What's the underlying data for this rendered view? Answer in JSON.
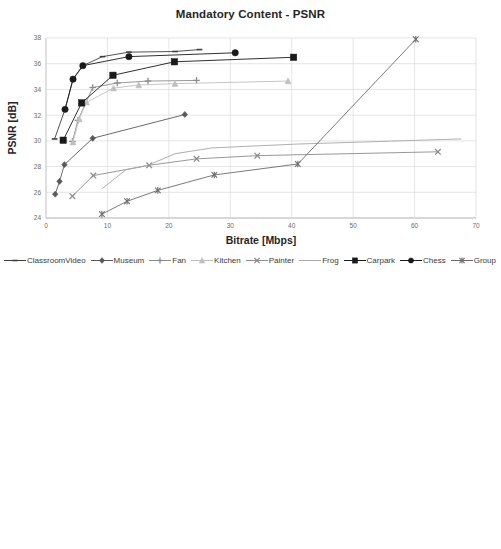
{
  "chart_data": [
    {
      "type": "line",
      "id": "mandatory-content-psnr",
      "title": "Mandatory Content - PSNR",
      "xlabel": "Bitrate [Mbps]",
      "ylabel": "PSNR [dB]",
      "xlim": [
        0,
        70
      ],
      "ylim": [
        24,
        38
      ],
      "xticks": [
        0,
        10,
        20,
        30,
        40,
        50,
        60,
        70
      ],
      "yticks": [
        24,
        26,
        28,
        30,
        32,
        34,
        36,
        38
      ],
      "grid": true,
      "legend_position": "bottom",
      "series": [
        {
          "name": "ClassroomVideo",
          "marker": "dash",
          "color": "#3f3f3f",
          "points": [
            [
              1.4,
              30.15
            ],
            [
              3.1,
              32.45
            ],
            [
              4.4,
              34.8
            ],
            [
              6.0,
              35.85
            ],
            [
              9.2,
              36.55
            ],
            [
              13.5,
              36.9
            ],
            [
              21.0,
              36.95
            ],
            [
              25.0,
              37.1
            ]
          ]
        },
        {
          "name": "Museum",
          "marker": "diamond",
          "color": "#595959",
          "points": [
            [
              1.5,
              25.85
            ],
            [
              2.2,
              26.85
            ],
            [
              3.0,
              28.15
            ],
            [
              7.6,
              30.2
            ],
            [
              22.6,
              32.05
            ]
          ]
        },
        {
          "name": "Fan",
          "marker": "plus",
          "color": "#8c8c8c",
          "points": [
            [
              4.3,
              29.95
            ],
            [
              5.2,
              31.6
            ],
            [
              7.6,
              34.15
            ],
            [
              11.6,
              34.5
            ],
            [
              16.6,
              34.65
            ],
            [
              24.5,
              34.7
            ]
          ]
        },
        {
          "name": "Kitchen",
          "marker": "triangle",
          "color": "#bfbfbf",
          "points": [
            [
              4.4,
              29.9
            ],
            [
              5.4,
              31.7
            ],
            [
              6.6,
              33.0
            ],
            [
              11.0,
              34.1
            ],
            [
              15.1,
              34.35
            ],
            [
              21.0,
              34.45
            ],
            [
              39.4,
              34.65
            ]
          ]
        },
        {
          "name": "Painter",
          "marker": "x",
          "color": "#8c8c8c",
          "points": [
            [
              4.3,
              25.7
            ],
            [
              7.7,
              27.3
            ],
            [
              16.8,
              28.1
            ],
            [
              24.5,
              28.6
            ],
            [
              34.4,
              28.85
            ],
            [
              63.8,
              29.15
            ]
          ]
        },
        {
          "name": "Frog",
          "marker": "none",
          "color": "#a6a6a6",
          "points": [
            [
              9.2,
              26.3
            ],
            [
              13.0,
              27.75
            ],
            [
              16.6,
              28.1
            ],
            [
              21.0,
              29.0
            ],
            [
              27.0,
              29.45
            ],
            [
              40.8,
              29.75
            ],
            [
              67.6,
              30.15
            ]
          ]
        },
        {
          "name": "Carpark",
          "marker": "square",
          "color": "#1a1a1a",
          "points": [
            [
              2.8,
              30.05
            ],
            [
              5.8,
              32.95
            ],
            [
              10.9,
              35.1
            ],
            [
              20.9,
              36.15
            ],
            [
              40.3,
              36.5
            ]
          ]
        },
        {
          "name": "Chess",
          "marker": "circle",
          "color": "#1a1a1a",
          "points": [
            [
              3.1,
              32.45
            ],
            [
              4.4,
              34.8
            ],
            [
              6.0,
              35.85
            ],
            [
              13.5,
              36.55
            ],
            [
              30.8,
              36.85
            ]
          ]
        },
        {
          "name": "Group",
          "marker": "asterisk",
          "color": "#6b6b6b",
          "points": [
            [
              9.1,
              24.3
            ],
            [
              13.2,
              25.3
            ],
            [
              18.2,
              26.15
            ],
            [
              27.4,
              27.35
            ],
            [
              41.0,
              28.2
            ],
            [
              60.2,
              37.9
            ]
          ]
        }
      ]
    },
    {
      "type": "line",
      "id": "optional-content-psnr",
      "title": "Optional Content - PSNR",
      "xlabel": "Bitrate [Mbps]",
      "ylabel": "PSNR [dB]",
      "xlim": [
        0,
        50
      ],
      "ylim": [
        25,
        45
      ],
      "xticks": [
        0,
        5,
        10,
        15,
        20,
        25,
        30,
        35,
        40,
        45,
        50
      ],
      "yticks": [
        25,
        27,
        29,
        31,
        33,
        35,
        37,
        39,
        41,
        43,
        45
      ],
      "grid": true,
      "legend_position": "bottom",
      "series": [
        {
          "name": "Fencing",
          "marker": "x",
          "color": "#3f3f3f",
          "points": [
            [
              2.6,
              29.35
            ],
            [
              4.6,
              32.95
            ],
            [
              10.7,
              34.75
            ],
            [
              20.8,
              35.2
            ],
            [
              46.2,
              35.4
            ]
          ]
        },
        {
          "name": "Hall",
          "marker": "none",
          "color": "#8c8c8c",
          "points": [
            [
              1.8,
              37.4
            ],
            [
              3.4,
              40.3
            ],
            [
              7.8,
              42.05
            ],
            [
              18.0,
              42.75
            ],
            [
              39.4,
              42.9
            ]
          ]
        },
        {
          "name": "Street",
          "marker": "diamond",
          "color": "#595959",
          "points": [
            [
              2.1,
              33.4
            ],
            [
              3.4,
              34.25
            ],
            [
              5.2,
              35.6
            ],
            [
              8.0,
              37.65
            ],
            [
              15.0,
              40.35
            ],
            [
              21.9,
              41.0
            ],
            [
              44.2,
              41.15
            ]
          ]
        },
        {
          "name": "ChessPieces",
          "marker": "circle",
          "color": "#a6a6a6",
          "points": [
            [
              2.0,
              31.2
            ],
            [
              3.4,
              34.25
            ],
            [
              4.9,
              35.2
            ],
            [
              5.6,
              35.55
            ],
            [
              9.8,
              36.3
            ],
            [
              18.0,
              36.35
            ],
            [
              21.9,
              36.85
            ],
            [
              41.0,
              37.0
            ]
          ]
        },
        {
          "name": "Hijack",
          "marker": "triangle",
          "color": "#595959",
          "points": [
            [
              4.6,
              33.15
            ],
            [
              5.5,
              35.25
            ],
            [
              8.0,
              37.65
            ],
            [
              15.0,
              40.35
            ],
            [
              28.7,
              41.0
            ],
            [
              44.2,
              41.15
            ]
          ]
        },
        {
          "name": "Mirror",
          "marker": "none",
          "color": "#a6a6a6",
          "points": [
            [
              3.9,
              27.35
            ],
            [
              6.5,
              30.4
            ],
            [
              11.9,
              33.25
            ],
            [
              20.7,
              35.25
            ],
            [
              28.7,
              35.5
            ],
            [
              41.0,
              35.95
            ]
          ]
        },
        {
          "name": "Cadillac",
          "marker": "plus",
          "color": "#3f3f3f",
          "points": [
            [
              4.6,
              27.4
            ],
            [
              8.0,
              30.15
            ],
            [
              13.4,
              32.45
            ],
            [
              20.7,
              33.65
            ],
            [
              27.7,
              34.3
            ]
          ]
        }
      ]
    }
  ],
  "charts": {
    "top": {
      "title": "Mandatory Content - PSNR",
      "xlabel": "Bitrate [Mbps]",
      "ylabel": "PSNR [dB]",
      "legend": [
        {
          "label": "ClassroomVideo",
          "marker": "dash",
          "color": "#3f3f3f"
        },
        {
          "label": "Museum",
          "marker": "diamond",
          "color": "#595959"
        },
        {
          "label": "Fan",
          "marker": "plus",
          "color": "#8c8c8c"
        },
        {
          "label": "Kitchen",
          "marker": "triangle",
          "color": "#bfbfbf"
        },
        {
          "label": "Painter",
          "marker": "x",
          "color": "#8c8c8c"
        },
        {
          "label": "Frog",
          "marker": "none",
          "color": "#a6a6a6"
        },
        {
          "label": "Carpark",
          "marker": "square",
          "color": "#1a1a1a"
        },
        {
          "label": "Chess",
          "marker": "circle",
          "color": "#1a1a1a"
        },
        {
          "label": "Group",
          "marker": "asterisk",
          "color": "#6b6b6b"
        }
      ]
    },
    "bottom": {
      "title": "Optional Content - PSNR",
      "xlabel": "Bitrate [Mbps]",
      "ylabel": "PSNR [dB]",
      "legend": [
        {
          "label": "Fencing",
          "marker": "x",
          "color": "#3f3f3f"
        },
        {
          "label": "Hall",
          "marker": "none",
          "color": "#8c8c8c"
        },
        {
          "label": "Street",
          "marker": "diamond",
          "color": "#595959"
        },
        {
          "label": "ChessPieces",
          "marker": "circle",
          "color": "#a6a6a6"
        },
        {
          "label": "Hijack",
          "marker": "triangle",
          "color": "#595959"
        },
        {
          "label": "Mirror",
          "marker": "none",
          "color": "#a6a6a6"
        },
        {
          "label": "Cadillac",
          "marker": "plus",
          "color": "#3f3f3f"
        }
      ]
    }
  }
}
